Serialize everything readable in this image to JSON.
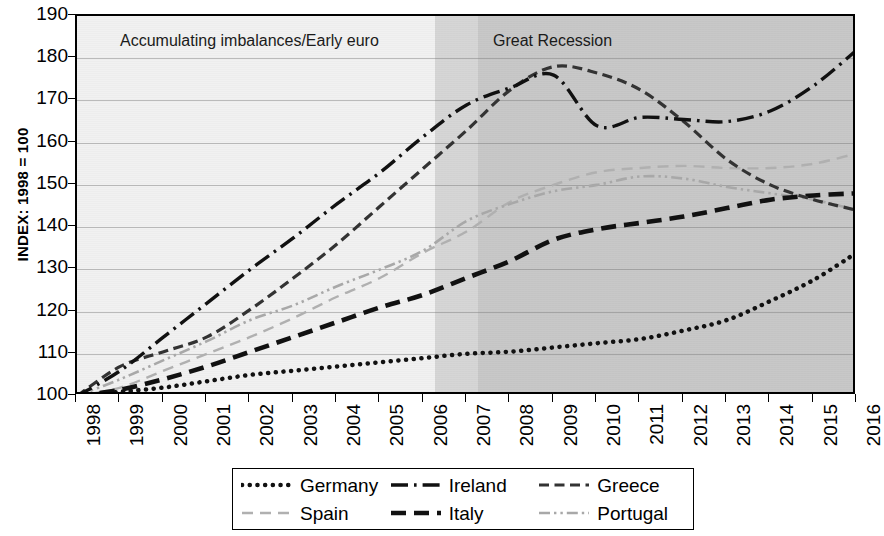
{
  "chart_data": {
    "type": "line",
    "title": "",
    "xlabel": "",
    "ylabel": "INDEX: 1998 = 100",
    "ylim": [
      100,
      190
    ],
    "yticks": [
      100,
      110,
      120,
      130,
      140,
      150,
      160,
      170,
      180,
      190
    ],
    "grid": true,
    "legend_position": "bottom",
    "x": [
      1998,
      1999,
      2000,
      2001,
      2002,
      2003,
      2004,
      2005,
      2006,
      2007,
      2008,
      2009,
      2010,
      2011,
      2012,
      2013,
      2014,
      2015,
      2016
    ],
    "categories": [
      "1998",
      "1999",
      "2000",
      "2001",
      "2002",
      "2003",
      "2004",
      "2005",
      "2006",
      "2007",
      "2008",
      "2009",
      "2010",
      "2011",
      "2012",
      "2013",
      "2014",
      "2015",
      "2016"
    ],
    "series": [
      {
        "name": "Germany",
        "style": "dotted",
        "color": "#111111",
        "values": [
          100,
          101,
          102,
          103.5,
          105,
          106,
          107,
          108,
          109,
          110,
          110.5,
          111.5,
          112.5,
          113.5,
          115.5,
          118,
          122.5,
          127.5,
          134
        ]
      },
      {
        "name": "Ireland",
        "style": "dash-dot",
        "color": "#111111",
        "values": [
          100,
          106,
          114,
          122,
          130,
          137.5,
          145.5,
          153,
          161.5,
          169,
          173,
          176,
          164,
          166,
          165.5,
          165,
          167.5,
          173.5,
          182
        ]
      },
      {
        "name": "Greece",
        "style": "dashed",
        "color": "#333333",
        "values": [
          100,
          107,
          110.5,
          114,
          120.5,
          128,
          136,
          145,
          154,
          163,
          172.5,
          178,
          176.5,
          172.5,
          165,
          156,
          150,
          146.5,
          144
        ]
      },
      {
        "name": "Spain",
        "style": "dashed-light",
        "color": "#b0b0b0",
        "values": [
          100,
          102,
          106,
          110,
          114,
          118.5,
          123.5,
          128,
          134,
          139,
          146,
          150,
          153,
          154,
          154.5,
          154,
          154,
          155,
          157.5
        ]
      },
      {
        "name": "Italy",
        "style": "dashed-thick",
        "color": "#111111",
        "values": [
          100,
          101.5,
          104,
          107,
          110.5,
          114,
          117.5,
          121,
          124,
          128,
          132,
          137,
          139.5,
          141,
          142.5,
          144.5,
          146.5,
          147.5,
          148
        ]
      },
      {
        "name": "Portugal",
        "style": "dash-dot-dot-light",
        "color": "#a8a8a8",
        "values": [
          100,
          104,
          108.5,
          113,
          118,
          121.5,
          126,
          130,
          134.5,
          141.5,
          145.5,
          148.5,
          150,
          152,
          151.5,
          149.5,
          148,
          146.5,
          144
        ]
      }
    ],
    "annotations": [
      {
        "text": "Accumulating imbalances/Early euro",
        "x_start": 1998,
        "x_end": 2007
      },
      {
        "text": "Great Recession",
        "x_start": 2008,
        "x_end": 2016
      }
    ],
    "shading": [
      {
        "label": "Accumulating imbalances/Early euro",
        "from": 1998,
        "to": 2007,
        "color": "#f1f1f1"
      },
      {
        "label": "Transition",
        "from": 2007,
        "to": 2008,
        "color": "#d6d6d6"
      },
      {
        "label": "Great Recession",
        "from": 2008,
        "to": 2016,
        "color": "#c8c8c8"
      }
    ]
  },
  "legend": {
    "items": [
      {
        "label": "Germany",
        "style": "dotted"
      },
      {
        "label": "Ireland",
        "style": "dash-dot"
      },
      {
        "label": "Greece",
        "style": "dashed"
      },
      {
        "label": "Spain",
        "style": "dashed-light"
      },
      {
        "label": "Italy",
        "style": "dashed-thick"
      },
      {
        "label": "Portugal",
        "style": "dash-dot-dot-light"
      }
    ]
  }
}
